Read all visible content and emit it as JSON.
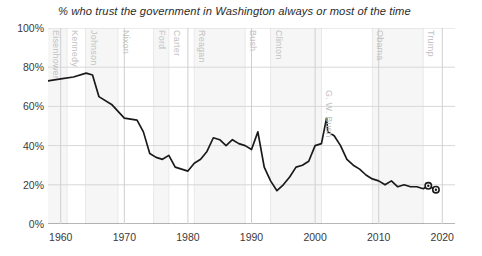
{
  "chart_data": {
    "type": "line",
    "title": "% who trust the government in Washington always or most of the time",
    "xlabel": "",
    "ylabel": "",
    "xlim": [
      1958,
      2022
    ],
    "ylim": [
      0,
      100
    ],
    "grid": true,
    "legend": false,
    "y_ticks": [
      "0%",
      "20%",
      "40%",
      "60%",
      "80%",
      "100%"
    ],
    "y_tick_values": [
      0,
      20,
      40,
      60,
      80,
      100
    ],
    "x_ticks": [
      "1960",
      "1970",
      "1980",
      "1990",
      "2000",
      "2010",
      "2020"
    ],
    "x_tick_values": [
      1960,
      1970,
      1980,
      1990,
      2000,
      2010,
      2020
    ],
    "line_color": "#1a1a1a",
    "grid_color": "#d8d8d8",
    "band_color": "#f6f6f6",
    "annotations": [
      {
        "label": "Eisenhower",
        "start": 1958,
        "end": 1961
      },
      {
        "label": "Kennedy",
        "start": 1961,
        "end": 1963.9
      },
      {
        "label": "Johnson",
        "start": 1963.9,
        "end": 1969
      },
      {
        "label": "Nixon",
        "start": 1969,
        "end": 1974.6
      },
      {
        "label": "Ford",
        "start": 1974.6,
        "end": 1977
      },
      {
        "label": "Carter",
        "start": 1977,
        "end": 1981
      },
      {
        "label": "Reagan",
        "start": 1981,
        "end": 1989
      },
      {
        "label": "Bush",
        "start": 1989,
        "end": 1993
      },
      {
        "label": "Clinton",
        "start": 1993,
        "end": 2001
      },
      {
        "label": "G. W. Bush",
        "start": 2001,
        "end": 2009
      },
      {
        "label": "Obama",
        "start": 2009,
        "end": 2017
      },
      {
        "label": "Trump",
        "start": 2017,
        "end": 2022
      }
    ],
    "markers": [
      {
        "x": 2017.8,
        "y": 19.5
      },
      {
        "x": 2019.0,
        "y": 17.5
      }
    ],
    "x": [
      1958,
      1960,
      1962,
      1964,
      1965,
      1966,
      1968,
      1970,
      1972,
      1973,
      1974,
      1975,
      1976,
      1977,
      1978,
      1979,
      1980,
      1981,
      1982,
      1983,
      1984,
      1985,
      1986,
      1987,
      1988,
      1989,
      1990,
      1991,
      1992,
      1993,
      1994,
      1995,
      1996,
      1997,
      1998,
      1999,
      2000,
      2001,
      2001.8,
      2002,
      2003,
      2004,
      2005,
      2006,
      2007,
      2008,
      2009,
      2010,
      2011,
      2012,
      2013,
      2014,
      2015,
      2016,
      2017,
      2017.8,
      2019
    ],
    "y": [
      73,
      74,
      75,
      77,
      76,
      65,
      61,
      54,
      53,
      47,
      36,
      34,
      33,
      35,
      29,
      28,
      27,
      31,
      33,
      37,
      44,
      43,
      40,
      43,
      41,
      40,
      38,
      47,
      29,
      22,
      17,
      20,
      24,
      29,
      30,
      32,
      40,
      41,
      54,
      47,
      45,
      40,
      33,
      30,
      28,
      25,
      23,
      22,
      20,
      22,
      19,
      20,
      19,
      19,
      18,
      19.5,
      17.5
    ]
  }
}
